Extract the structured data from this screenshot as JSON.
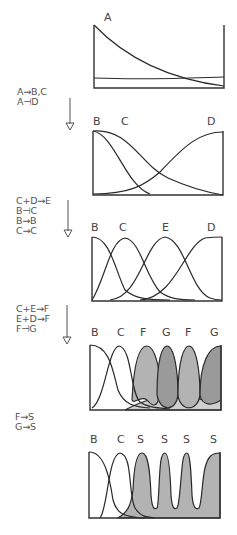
{
  "colors": {
    "ink": "#2a2a2a",
    "text": "#555555",
    "shade_light": "#cfcfcf",
    "shade_mid": "#b3b3b3",
    "shade_dark": "#9a9a9a"
  },
  "stages": [
    {
      "id": "stage-1",
      "frame": {
        "x": 94,
        "y": 25,
        "w": 130,
        "h": 63
      },
      "labels": [
        {
          "text": "A",
          "x": 104,
          "y": 21
        }
      ],
      "curves": [
        {
          "name": "A-gradient",
          "d": "M94,25 C120,52 160,78 224,86",
          "fill": null
        },
        {
          "name": "baseline-flat",
          "d": "M94,78 C150,80 190,78 224,77",
          "fill": null
        }
      ]
    },
    {
      "id": "stage-2",
      "frame": {
        "x": 93,
        "y": 131,
        "w": 130,
        "h": 64
      },
      "labels": [
        {
          "text": "B",
          "x": 93,
          "y": 125
        },
        {
          "text": "C",
          "x": 121,
          "y": 125
        },
        {
          "text": "D",
          "x": 207,
          "y": 125
        }
      ],
      "curves": [
        {
          "name": "B-gradient",
          "d": "M93,131 C115,135 125,185 150,194",
          "fill": null
        },
        {
          "name": "C-gradient",
          "d": "M93,131 C130,128 140,165 168,178 C190,188 205,192 223,195",
          "fill": null
        },
        {
          "name": "D-gradient",
          "d": "M93,194 C130,194 145,185 160,172 C185,145 200,132 223,132",
          "fill": null
        }
      ]
    },
    {
      "id": "stage-3",
      "frame": {
        "x": 92,
        "y": 237,
        "w": 130,
        "h": 64
      },
      "labels": [
        {
          "text": "B",
          "x": 91,
          "y": 231
        },
        {
          "text": "C",
          "x": 119,
          "y": 231
        },
        {
          "text": "E",
          "x": 162,
          "y": 231
        },
        {
          "text": "D",
          "x": 207,
          "y": 231
        }
      ],
      "curves": [
        {
          "name": "B-band",
          "d": "M92,237 C110,237 115,270 125,290 C135,299 150,300 170,300",
          "fill": null
        },
        {
          "name": "C-band",
          "d": "M92,300 C105,280 110,240 125,238 C140,240 145,275 160,292 C170,299 180,300 195,300",
          "fill": null
        },
        {
          "name": "E-band",
          "d": "M110,300 C140,298 145,240 165,237 C185,240 190,290 210,298 C215,300 220,300 222,300",
          "fill": null
        },
        {
          "name": "D-band",
          "d": "M140,300 C175,298 185,245 205,238 C213,237 218,237 222,237",
          "fill": null
        }
      ]
    },
    {
      "id": "stage-4",
      "frame": {
        "x": 90,
        "y": 345,
        "w": 131,
        "h": 65
      },
      "labels": [
        {
          "text": "B",
          "x": 91,
          "y": 336
        },
        {
          "text": "C",
          "x": 117,
          "y": 336
        },
        {
          "text": "F",
          "x": 140,
          "y": 336
        },
        {
          "text": "G",
          "x": 162,
          "y": 336
        },
        {
          "text": "F",
          "x": 185,
          "y": 336
        },
        {
          "text": "G",
          "x": 210,
          "y": 336
        }
      ],
      "curves": [
        {
          "name": "shaded-background",
          "d": "M125,410 C140,402 150,398 170,398 C190,398 205,400 221,400 L221,410 Z",
          "fill": "shade_light"
        },
        {
          "name": "F-stripe-1",
          "d": "M132,400 C134,360 140,346 147,346 C155,346 160,370 160,385 C160,405 155,410 147,400 C140,395 134,405 132,400 Z",
          "fill": "shade_mid"
        },
        {
          "name": "G-stripe-1",
          "d": "M157,395 C157,360 162,346 167,346 C174,346 178,370 178,395 C176,412 160,412 157,395 Z",
          "fill": "shade_dark"
        },
        {
          "name": "F-stripe-2",
          "d": "M178,395 C178,360 184,346 189,346 C196,346 200,370 200,395 C198,412 180,412 178,395 Z",
          "fill": "shade_mid"
        },
        {
          "name": "G-stripe-2",
          "d": "M200,395 C200,365 208,346 221,346 L221,400 C212,406 202,406 200,395 Z",
          "fill": "shade_dark"
        },
        {
          "name": "B-stripe",
          "d": "M90,345 C110,345 113,372 118,390 C124,405 135,407 150,408",
          "fill": null
        },
        {
          "name": "C-stripe",
          "d": "M92,408 C105,400 108,348 119,346 C132,348 130,392 140,402 C148,408 160,408 170,409",
          "fill": null
        }
      ]
    },
    {
      "id": "stage-5",
      "frame": {
        "x": 89,
        "y": 452,
        "w": 131,
        "h": 66
      },
      "labels": [
        {
          "text": "B",
          "x": 90,
          "y": 443
        },
        {
          "text": "C",
          "x": 117,
          "y": 443
        },
        {
          "text": "S",
          "x": 137,
          "y": 443
        },
        {
          "text": "S",
          "x": 161,
          "y": 443
        },
        {
          "text": "S",
          "x": 183,
          "y": 443
        },
        {
          "text": "S",
          "x": 210,
          "y": 443
        }
      ],
      "curves": [
        {
          "name": "S-segments",
          "d": "M118,518 C128,512 131,505 133,490 C134,465 137,453 142,453 C148,453 150,470 151,495 C152,508 154,510 157,508 C159,505 159,470 161,460 C162,454 164,453 165,453 C168,453 170,465 171,495 C172,508 174,510 177,508 C180,505 181,470 183,460 C184,454 186,453 187,453 C190,453 191,470 192,495 C193,508 196,510 199,508 C202,503 202,480 205,468 C208,456 212,453 220,453 L220,518 Z",
          "fill": "shade_mid"
        },
        {
          "name": "B-segment",
          "d": "M89,452 C105,452 110,480 113,500 C117,515 125,517 145,518",
          "fill": null
        },
        {
          "name": "C-segment",
          "d": "M100,518 C108,508 108,455 120,453 C133,455 128,495 135,508 C140,516 145,517 155,518",
          "fill": null
        }
      ]
    }
  ],
  "rules": [
    {
      "id": "rules-1",
      "x": 17,
      "lines": [
        "A→B,C",
        "A⊣D"
      ],
      "y0": 95,
      "arrow": {
        "x": 70,
        "y1": 98,
        "y2": 130
      }
    },
    {
      "id": "rules-2",
      "x": 16,
      "lines": [
        "C+D→E",
        "B⊣C",
        "B→B",
        "C→C"
      ],
      "y0": 204,
      "arrow": {
        "x": 68,
        "y1": 200,
        "y2": 237
      }
    },
    {
      "id": "rules-3",
      "x": 16,
      "lines": [
        "C+E→F",
        "E+D→F",
        "F⊣G"
      ],
      "y0": 312,
      "arrow": {
        "x": 67,
        "y1": 305,
        "y2": 344
      }
    },
    {
      "id": "rules-4",
      "x": 15,
      "lines": [
        "F→S",
        "G→S"
      ],
      "y0": 420,
      "arrow": null
    }
  ]
}
